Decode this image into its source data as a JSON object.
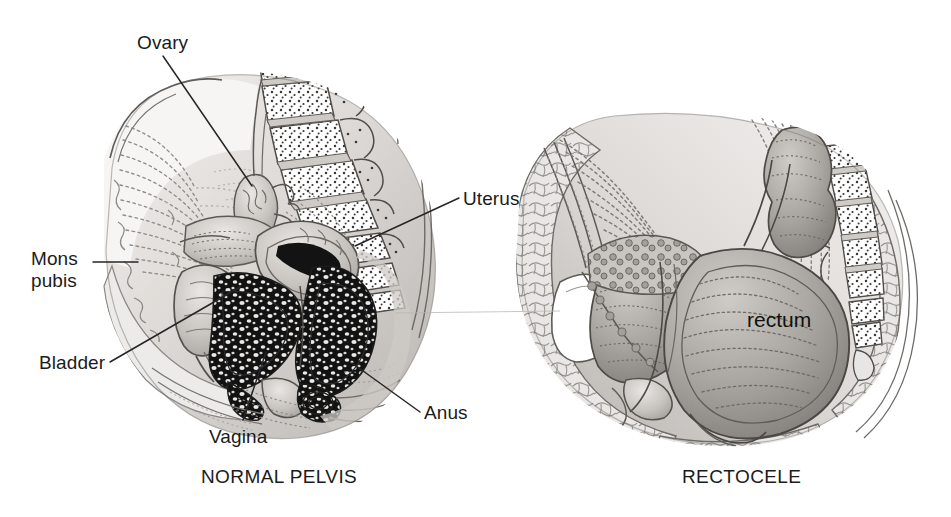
{
  "figure": {
    "background_color": "#ffffff",
    "ink_color": "#1b1b1b",
    "line_color": "#4a4a4a"
  },
  "panels": [
    {
      "id": "normal-pelvis",
      "caption": "NORMAL PELVIS",
      "caption_x": 201,
      "caption_y": 466,
      "labels": [
        {
          "name": "ovary",
          "text": "Ovary",
          "x": 137,
          "y": 32,
          "lines": 1
        },
        {
          "name": "mons-pubis",
          "text": "Mons\npubis",
          "x": 31,
          "y": 248,
          "lines": 2
        },
        {
          "name": "bladder",
          "text": "Bladder",
          "x": 39,
          "y": 352,
          "lines": 1
        },
        {
          "name": "vagina",
          "text": "Vagina",
          "x": 209,
          "y": 426,
          "lines": 1
        },
        {
          "name": "uterus",
          "text": "Uterus",
          "x": 463,
          "y": 188,
          "lines": 1
        },
        {
          "name": "anus",
          "text": "Anus",
          "x": 424,
          "y": 402,
          "lines": 1
        }
      ],
      "leader_lines": [
        {
          "name": "ovary-leader",
          "x1": 163,
          "y1": 56,
          "x2": 252,
          "y2": 186
        },
        {
          "name": "mons-pubis-leader",
          "x1": 93,
          "y1": 262,
          "x2": 138,
          "y2": 262
        },
        {
          "name": "bladder-leader",
          "x1": 110,
          "y1": 362,
          "x2": 240,
          "y2": 287
        },
        {
          "name": "vagina-leader",
          "x1": 243,
          "y1": 420,
          "x2": 266,
          "y2": 352
        },
        {
          "name": "uterus-leader",
          "x1": 459,
          "y1": 198,
          "x2": 355,
          "y2": 246
        },
        {
          "name": "anus-leader",
          "x1": 420,
          "y1": 412,
          "x2": 352,
          "y2": 363
        }
      ]
    },
    {
      "id": "rectocele",
      "caption": "RECTOCELE",
      "caption_x": 682,
      "caption_y": 466,
      "labels": [
        {
          "name": "rectum",
          "text": "rectum",
          "x": 747,
          "y": 308,
          "lines": 1
        }
      ],
      "leader_lines": []
    }
  ],
  "annotations": {
    "scan_artifact_line": {
      "name": "scan-artifact-line",
      "x1": 395,
      "y1": 313,
      "x2": 560,
      "y2": 311
    }
  },
  "palette": {
    "tissue_light": "#e4e2e0",
    "tissue_mid": "#c2bfbc",
    "tissue_dark": "#9a9794",
    "tissue_darker": "#6f6c69",
    "bone_fill": "#fbfbfb",
    "dark_ink": "#161616",
    "outline": "#55514e"
  }
}
